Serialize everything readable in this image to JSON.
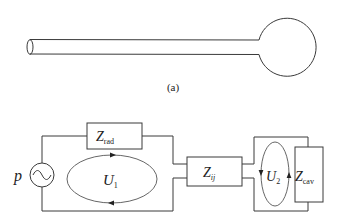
{
  "figure": {
    "subfigure_label": "(a)"
  },
  "circuit": {
    "source": {
      "label": "p",
      "icon": "ac-source-icon"
    },
    "impedances": {
      "radiation": {
        "base": "Z",
        "sub": "rad"
      },
      "coupling": {
        "base": "Z",
        "sub": "ij"
      },
      "cavity": {
        "base": "Z",
        "sub": "cav"
      }
    },
    "loops": {
      "first": {
        "base": "U",
        "sub": "1",
        "direction": "clockwise"
      },
      "second": {
        "base": "U",
        "sub": "2",
        "direction": "counter-clockwise"
      }
    }
  },
  "colors": {
    "stroke": "#3a3a3a",
    "background": "#ffffff"
  }
}
